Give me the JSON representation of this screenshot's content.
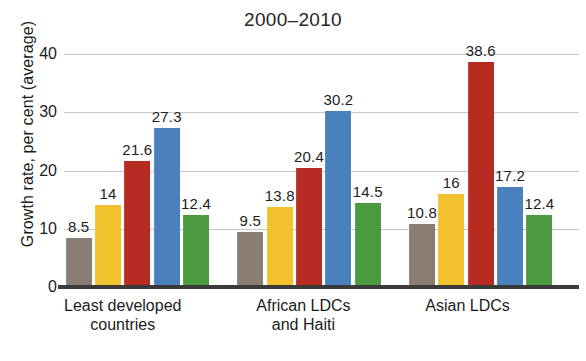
{
  "chart_data": {
    "type": "bar",
    "title": "2000–2010",
    "xlabel": "",
    "ylabel": "Growth rate, per cent (average)",
    "ylim": [
      0,
      40
    ],
    "yticks": [
      0,
      10,
      20,
      30,
      40
    ],
    "ytick_labels": [
      "0",
      "10",
      "20",
      "30",
      "40"
    ],
    "grid": true,
    "legend": "none",
    "categories": [
      "Least developed countries",
      "African LDCs and Haiti",
      "Asian LDCs"
    ],
    "category_lines": [
      [
        "Least developed",
        "countries"
      ],
      [
        "African LDCs",
        "and Haiti"
      ],
      [
        "Asian LDCs"
      ]
    ],
    "series": [
      {
        "name": "series-1",
        "color": "#8a7d73",
        "values": [
          8.5,
          9.5,
          10.8
        ],
        "labels": [
          "8.5",
          "9.5",
          "10.8"
        ]
      },
      {
        "name": "series-2",
        "color": "#f2c22e",
        "values": [
          14,
          13.8,
          16
        ],
        "labels": [
          "14",
          "13.8",
          "16"
        ]
      },
      {
        "name": "series-3",
        "color": "#b62c22",
        "values": [
          21.6,
          20.4,
          38.6
        ],
        "labels": [
          "21.6",
          "20.4",
          "38.6"
        ]
      },
      {
        "name": "series-4",
        "color": "#4a80bd",
        "values": [
          27.3,
          30.2,
          17.2
        ],
        "labels": [
          "27.3",
          "30.2",
          "17.2"
        ]
      },
      {
        "name": "series-5",
        "color": "#4c9a3f",
        "values": [
          12.4,
          14.5,
          12.4
        ],
        "labels": [
          "12.4",
          "14.5",
          "12.4"
        ]
      }
    ]
  }
}
